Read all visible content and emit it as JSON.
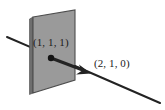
{
  "figure": {
    "type": "geometry-diagram",
    "background_color": "#ffffff",
    "plane": {
      "name": "shaded-plane",
      "fill_color": "#9a9a9a",
      "edge_color": "#4d4d4d",
      "side_edge_color": "#6e6e6e",
      "corners": {
        "top_left": [
          33,
          17
        ],
        "top_right": [
          75,
          10
        ],
        "bottom_right": [
          75,
          80
        ],
        "bottom_left": [
          33,
          93
        ]
      }
    },
    "line": {
      "name": "intersecting-line",
      "color": "#232323",
      "start": [
        7,
        37
      ],
      "end": [
        160,
        103
      ],
      "width": 2
    },
    "vector": {
      "name": "direction-vector",
      "color": "#232323",
      "tail": [
        51,
        58
      ],
      "tip": [
        91,
        73
      ],
      "width": 3
    },
    "point": {
      "name": "marked-point",
      "color": "#141414",
      "position": [
        51,
        58
      ],
      "radius": 3.2
    },
    "labels": {
      "point_label": "(1, 1, 1)",
      "vector_label": "(2, 1, 0)"
    }
  }
}
